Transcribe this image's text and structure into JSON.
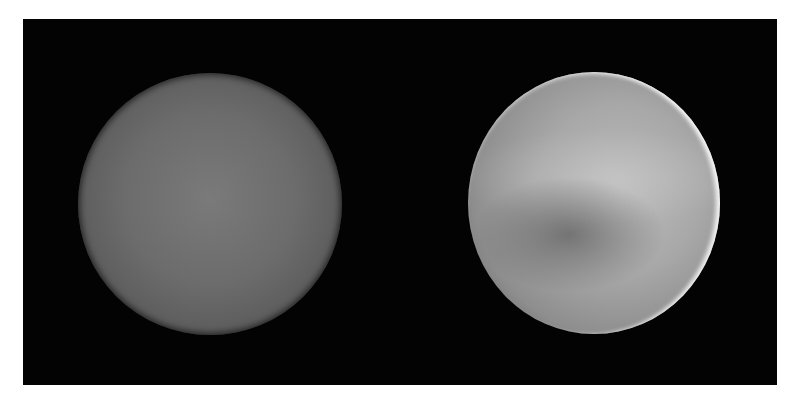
{
  "figure": {
    "panels": [
      {
        "id": "left",
        "label": "",
        "appearance": "uniform, featureless grey disk"
      },
      {
        "id": "right",
        "label": "",
        "appearance": "grey disk with darker curved band and bright limb on upper-right edge"
      }
    ]
  },
  "colors": {
    "background": "#030303",
    "page": "#ffffff",
    "left_disk": "#6c6c6c",
    "right_disk": "#a8a8a8"
  }
}
